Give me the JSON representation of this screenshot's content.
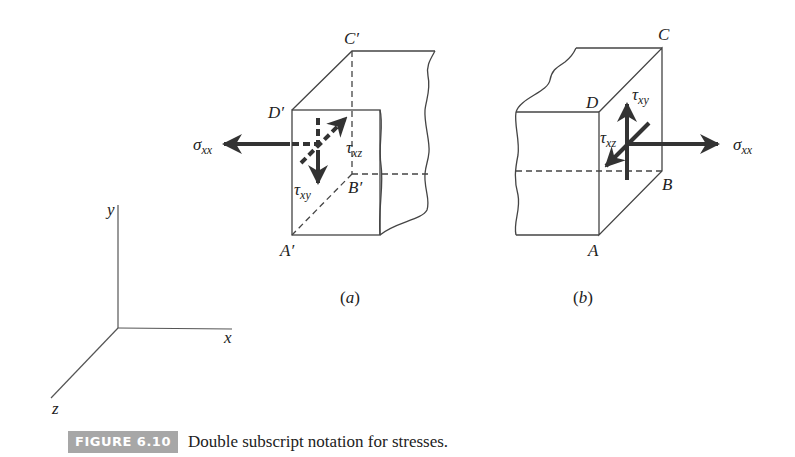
{
  "figure": {
    "number_label": "FIGURE 6.10",
    "caption": "Double subscript notation for stresses.",
    "badge_color": "#a7a7a7",
    "line_color": "#444444",
    "arrow_color": "#333333"
  },
  "axes": {
    "x_label": "x",
    "y_label": "y",
    "z_label": "z"
  },
  "panel_a": {
    "label_open": "(",
    "label_letter": "a",
    "label_close": ")",
    "vertices": {
      "front_top": "D′",
      "back_top": "C′",
      "back_bottom": "B′",
      "front_bottom": "A′"
    },
    "stresses": {
      "normal": {
        "symbol": "σ",
        "subscript": "xx",
        "direction": "left (−x)"
      },
      "shear_y": {
        "symbol": "τ",
        "subscript": "xy",
        "direction": "down (−y)"
      },
      "shear_z": {
        "symbol": "τ",
        "subscript": "xz",
        "direction": "back (−z)"
      }
    }
  },
  "panel_b": {
    "label_open": "(",
    "label_letter": "b",
    "label_close": ")",
    "vertices": {
      "front_top": "D",
      "back_top": "C",
      "back_bottom": "B",
      "front_bottom": "A"
    },
    "stresses": {
      "normal": {
        "symbol": "σ",
        "subscript": "xx",
        "direction": "right (+x)"
      },
      "shear_y": {
        "symbol": "τ",
        "subscript": "xy",
        "direction": "up (+y)"
      },
      "shear_z": {
        "symbol": "τ",
        "subscript": "xz",
        "direction": "forward (+z)"
      }
    }
  }
}
